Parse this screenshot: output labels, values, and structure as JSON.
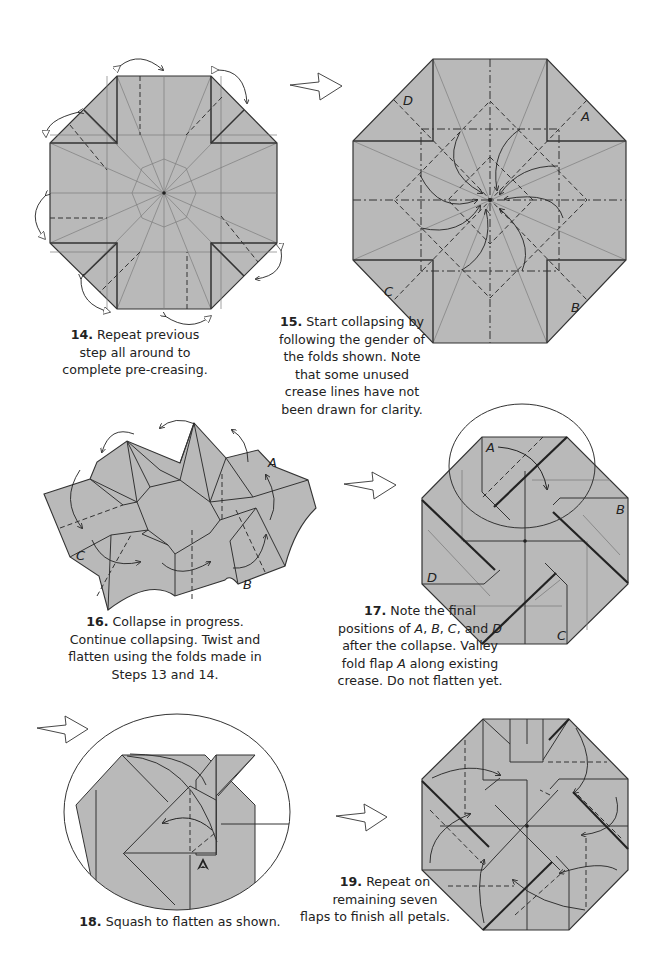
{
  "steps": [
    {
      "number": "14.",
      "text_lines": [
        "Repeat previous",
        "step all around to",
        "complete pre-creasing."
      ],
      "labels": []
    },
    {
      "number": "15.",
      "text_lines": [
        "Start collapsing by",
        "following the gender of",
        "the folds shown.  Note",
        "that some unused",
        "crease lines have not",
        "been drawn for clarity."
      ],
      "labels": [
        "A",
        "B",
        "C",
        "D"
      ]
    },
    {
      "number": "16.",
      "text_lines": [
        "Collapse in progress.",
        "Continue collapsing.  Twist and",
        "flatten using the folds made in",
        "Steps 13 and 14."
      ],
      "labels": [
        "A",
        "B",
        "C"
      ]
    },
    {
      "number": "17.",
      "text_lines": [
        "Note the final",
        "positions of A, B, C, and D",
        "after the collapse.  Valley",
        "fold flap A along existing",
        "crease. Do not flatten yet."
      ],
      "labels": [
        "A",
        "B",
        "C",
        "D"
      ]
    },
    {
      "number": "18.",
      "text_lines": [
        "Squash to flatten as shown."
      ],
      "labels": []
    },
    {
      "number": "19.",
      "text_lines": [
        "Repeat on",
        "remaining seven",
        "flaps to finish all petals."
      ],
      "labels": []
    }
  ],
  "colors": {
    "paper": "#b9b9b9",
    "line": "#333333",
    "crease": "#7a7a7a",
    "background": "#ffffff"
  }
}
